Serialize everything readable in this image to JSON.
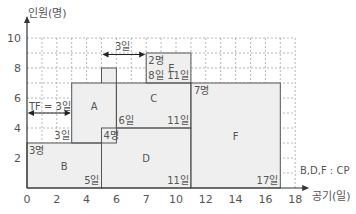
{
  "chart_data": {
    "type": "area",
    "title": "",
    "ylabel": "인원(명)",
    "xlabel": "공기(일)",
    "xlim": [
      0,
      18
    ],
    "ylim": [
      0,
      10
    ],
    "grid": true,
    "x_ticks": [
      "0",
      "2",
      "4",
      "6",
      "7",
      "10",
      "12",
      "14",
      "16",
      "18"
    ],
    "y_ticks": [
      "2",
      "4",
      "6",
      "8",
      "10"
    ],
    "activities": [
      {
        "name": "B",
        "start": 0,
        "end": 5,
        "workers": 3,
        "base": 0,
        "workers_label": "3명",
        "end_label": "5일"
      },
      {
        "name": "A",
        "start": 3,
        "end": 6,
        "workers": 4,
        "base": 3,
        "start_label": "3일"
      },
      {
        "name": "D",
        "start": 5,
        "end": 11,
        "workers": 4,
        "base": 0,
        "workers_label": "4명",
        "end_label": "11일"
      },
      {
        "name": "C",
        "start": 6,
        "end": 11,
        "workers": 3,
        "base": 4,
        "start_label": "6일",
        "end_label": "11일"
      },
      {
        "name": "E",
        "start": 8,
        "end": 11,
        "workers": 2,
        "base": 7,
        "workers_label": "2명",
        "start_label": "8일",
        "end_label": "11일"
      },
      {
        "name": "F",
        "start": 11,
        "end": 17,
        "workers": 7,
        "base": 0,
        "workers_label": "7명",
        "end_label": "17일"
      }
    ],
    "profile": [
      {
        "x0": 0,
        "x1": 3,
        "y": 3
      },
      {
        "x0": 3,
        "x1": 5,
        "y": 7
      },
      {
        "x0": 5,
        "x1": 6,
        "y": 8
      },
      {
        "x0": 6,
        "x1": 8,
        "y": 7
      },
      {
        "x0": 8,
        "x1": 11,
        "y": 9
      },
      {
        "x0": 11,
        "x1": 17,
        "y": 7
      }
    ],
    "annotations": {
      "tf_label": "TF = 3일",
      "float_label": "3일",
      "cp_label": "B,D,F : CP"
    }
  }
}
